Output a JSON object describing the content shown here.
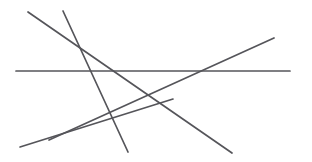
{
  "figure": {
    "name": "intersecting-line-segments",
    "width": 312,
    "height": 162,
    "background_color": "#ffffff",
    "stroke_color": "#55555a",
    "stroke_width": 1.7,
    "line_count": 5
  },
  "chart_data": {
    "type": "line",
    "title": "",
    "xlabel": "",
    "ylabel": "",
    "xlim": [
      0,
      312
    ],
    "ylim": [
      0,
      162
    ],
    "grid": false,
    "legend": "none",
    "series": [
      {
        "name": "horizontal-line",
        "x": [
          16,
          290
        ],
        "y": [
          71,
          71
        ],
        "color": "#55555a"
      },
      {
        "name": "long-descending-diagonal",
        "x": [
          28,
          232
        ],
        "y": [
          12,
          153
        ],
        "color": "#55555a"
      },
      {
        "name": "steep-descending-line",
        "x": [
          63,
          128
        ],
        "y": [
          11,
          152
        ],
        "color": "#55555a"
      },
      {
        "name": "descending-left-line",
        "x": [
          173,
          20
        ],
        "y": [
          99,
          147
        ],
        "color": "#55555a"
      },
      {
        "name": "rising-diagonal",
        "x": [
          49,
          274
        ],
        "y": [
          140,
          38
        ],
        "color": "#55555a"
      }
    ]
  }
}
